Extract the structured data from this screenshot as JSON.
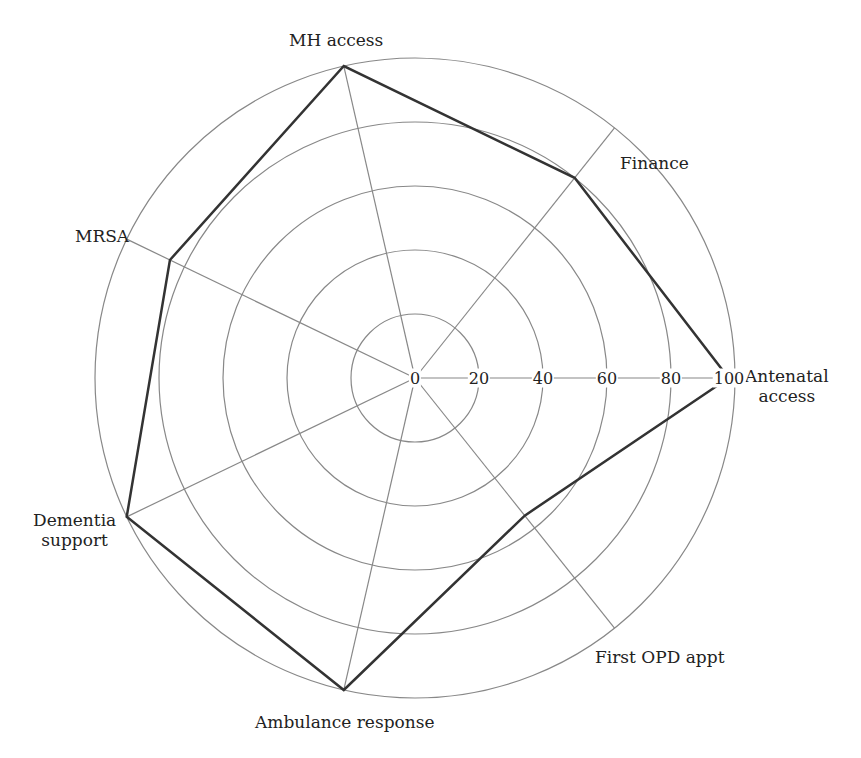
{
  "chart_data": {
    "type": "radar",
    "title": "",
    "axes": [
      "Antenatal access",
      "First OPD appt",
      "Ambulance response",
      "Dementia support",
      "MRSA",
      "MH access",
      "Finance"
    ],
    "values": [
      98,
      55,
      100,
      100,
      85,
      100,
      80
    ],
    "radial_ticks": [
      "0",
      "20",
      "40",
      "60",
      "80",
      "100"
    ],
    "rlim": [
      0,
      100
    ],
    "grid": true,
    "series_color": "#333333",
    "grid_color": "#888888"
  },
  "labels": {
    "antenatal": "Antenatal\naccess",
    "first_opd": "First OPD appt",
    "ambulance": "Ambulance response",
    "dementia": "Dementia\nsupport",
    "mrsa": "MRSA",
    "mh": "MH access",
    "finance": "Finance"
  }
}
